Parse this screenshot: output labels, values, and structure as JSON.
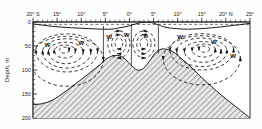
{
  "figure": {
    "type": "oceanographic-cross-section",
    "background": "#fdfdfd",
    "ink": "#1a1a1a",
    "seafloor_fill": "#d9d9d9"
  },
  "axes": {
    "x": {
      "label": "",
      "orientation": "top",
      "range_deg": [
        -20,
        25
      ],
      "tick_labels": [
        "20° S",
        "15°",
        "10°",
        "5°",
        "0°",
        "5°",
        "10°",
        "15°",
        "20° N",
        "25°"
      ],
      "tick_values": [
        -20,
        -15,
        -10,
        -5,
        0,
        5,
        10,
        15,
        20,
        25
      ],
      "minor_ticks_per_interval": 5
    },
    "y": {
      "label": "Depth, m",
      "orientation": "left",
      "range_m": [
        0,
        200
      ],
      "direction": "downward",
      "tick_labels": [
        "0",
        "50",
        "100",
        "150",
        "200"
      ],
      "tick_values": [
        0,
        50,
        100,
        150,
        200
      ]
    }
  },
  "annotations": {
    "cell_labels": [
      {
        "text": "W",
        "x_deg": -17.0,
        "depth_m": 48
      },
      {
        "text": "W",
        "x_deg": -10.0,
        "depth_m": 44
      },
      {
        "text": "W",
        "x_deg": -4.2,
        "depth_m": 30
      },
      {
        "text": "W",
        "x_deg": -0.6,
        "depth_m": 27
      },
      {
        "text": "E",
        "x_deg": 3.4,
        "depth_m": 29
      },
      {
        "text": "W",
        "x_deg": 10.5,
        "depth_m": 30
      },
      {
        "text": "W",
        "x_deg": 17.5,
        "depth_m": 42
      },
      {
        "text": "W",
        "x_deg": 21.5,
        "depth_m": 70
      }
    ],
    "surface_dashed_line_depth_m": 5
  },
  "chart_data": {
    "type": "line",
    "title": "",
    "xlabel": "",
    "ylabel": "Depth, m",
    "xlim": [
      -20,
      25
    ],
    "ylim": [
      200,
      0
    ],
    "grid": false,
    "legend": "none",
    "series": [
      {
        "name": "seafloor-bathymetry",
        "kind": "filled-profile",
        "x": [
          -20,
          -18,
          -16,
          -14,
          -12,
          -10,
          -8,
          -6,
          -4.6,
          -3.2,
          -1.6,
          0.2,
          1.6,
          3.0,
          4.4,
          5.6,
          7.0,
          9.0,
          11.0,
          13.0,
          15.0,
          17.0,
          19.0,
          21.0,
          23.0,
          25.0
        ],
        "depth_m": [
          172,
          170,
          163,
          150,
          135,
          120,
          104,
          88,
          76,
          70,
          72,
          88,
          100,
          96,
          78,
          62,
          56,
          62,
          78,
          96,
          116,
          134,
          152,
          168,
          184,
          200
        ]
      },
      {
        "name": "pycnocline-surface",
        "kind": "line",
        "x": [
          -20,
          -16,
          -12,
          -8,
          -4,
          -2,
          0,
          2,
          4,
          6,
          8,
          12,
          16,
          20,
          25
        ],
        "depth_m": [
          4,
          9,
          12,
          14,
          15,
          12,
          8,
          2,
          0,
          6,
          12,
          15,
          13,
          9,
          3
        ]
      },
      {
        "name": "circulation-streamlines",
        "kind": "dashed-closed-contours-with-arrows",
        "description": "Nested dashed streamline contours with arrowheads describing counter-rotating meridional circulation cells"
      }
    ],
    "cells": [
      {
        "id": "south-gyre",
        "label": "W",
        "x_range_deg": [
          -20,
          -6
        ],
        "depth_range_m": [
          5,
          160
        ],
        "rotation": "clockwise"
      },
      {
        "id": "equatorial-west-cell",
        "label": "W",
        "x_range_deg": [
          -5.5,
          1.0
        ],
        "depth_range_m": [
          5,
          92
        ],
        "rotation": "clockwise"
      },
      {
        "id": "equatorial-east-cell",
        "label": "E",
        "x_range_deg": [
          1.0,
          6.0
        ],
        "depth_range_m": [
          5,
          92
        ],
        "rotation": "counter-clockwise"
      },
      {
        "id": "north-gyre",
        "label": "W",
        "x_range_deg": [
          6,
          25
        ],
        "depth_range_m": [
          5,
          170
        ],
        "rotation": "counter-clockwise"
      }
    ]
  }
}
